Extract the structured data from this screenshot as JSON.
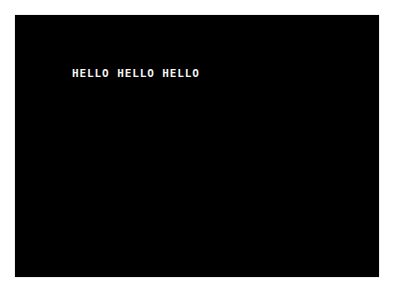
{
  "screen": {
    "background_color": "#000000",
    "text_color": "#f4f4f4",
    "output_lines": [
      "HELLO HELLO HELLO"
    ]
  }
}
